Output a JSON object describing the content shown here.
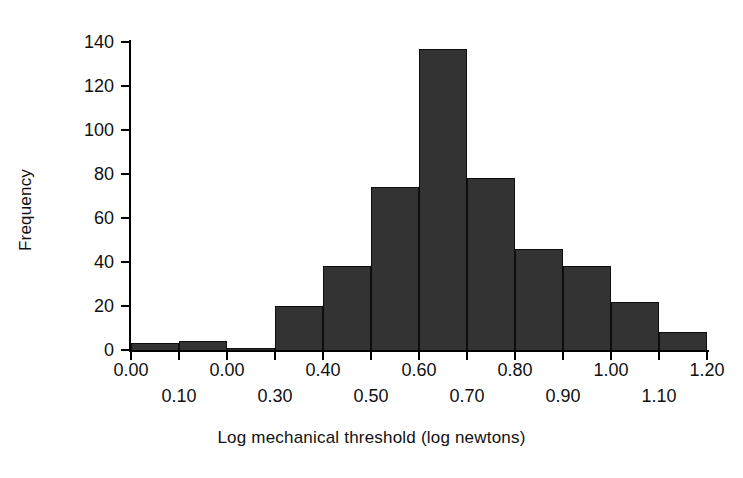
{
  "chart_data": {
    "type": "bar",
    "title": "",
    "subtitle": "",
    "xlabel": "Log mechanical threshold (log newtons)",
    "ylabel": "Frequency",
    "grid": false,
    "legend": null,
    "ylim": [
      0,
      140
    ],
    "ytick_values": [
      140,
      120,
      100,
      80,
      60,
      40,
      20,
      0
    ],
    "ytick_labels": [
      "140",
      "120",
      "100",
      "80",
      "60",
      "40",
      "20",
      "0"
    ],
    "xlim": [
      0.0,
      1.2
    ],
    "bin_width": 0.1,
    "bin_edges": [
      0.0,
      0.1,
      0.2,
      0.3,
      0.4,
      0.5,
      0.6,
      0.7,
      0.8,
      0.9,
      1.0,
      1.1,
      1.2
    ],
    "categories": [
      "0.00-0.10",
      "0.10-0.20",
      "0.20-0.30",
      "0.30-0.40",
      "0.40-0.50",
      "0.50-0.60",
      "0.60-0.70",
      "0.70-0.80",
      "0.80-0.90",
      "0.90-1.00",
      "1.00-1.10",
      "1.10-1.20"
    ],
    "values": [
      3,
      4,
      1,
      20,
      38,
      74,
      137,
      78,
      46,
      38,
      22,
      8
    ],
    "bar_color": "#333333",
    "bar_edge_color": "#0d0d0d",
    "axis_color": "#000000",
    "background_color": "#ffffff",
    "xtick_rows": {
      "top": [
        {
          "label": "0.00",
          "value": 0.0
        },
        {
          "label": "0.00",
          "value": 0.2
        },
        {
          "label": "0.40",
          "value": 0.4
        },
        {
          "label": "0.60",
          "value": 0.6
        },
        {
          "label": "0.80",
          "value": 0.8
        },
        {
          "label": "1.00",
          "value": 1.0
        },
        {
          "label": "1.20",
          "value": 1.2
        }
      ],
      "bottom": [
        {
          "label": "0.10",
          "value": 0.1
        },
        {
          "label": "0.30",
          "value": 0.3
        },
        {
          "label": "0.50",
          "value": 0.5
        },
        {
          "label": "0.70",
          "value": 0.7
        },
        {
          "label": "0.90",
          "value": 0.9
        },
        {
          "label": "1.10",
          "value": 1.1
        }
      ]
    }
  }
}
